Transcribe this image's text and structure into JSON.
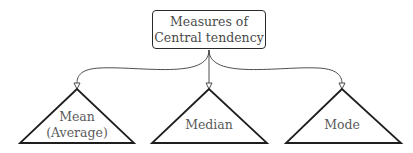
{
  "diagram": {
    "root": {
      "label": "Measures of Central tendency"
    },
    "children": [
      {
        "label_line1": "Mean",
        "label_line2": "(Average)"
      },
      {
        "label_line1": "Median"
      },
      {
        "label_line1": "Mode"
      }
    ],
    "colors": {
      "stroke": "#2a2a2a",
      "text": "#4a4a4a"
    }
  }
}
